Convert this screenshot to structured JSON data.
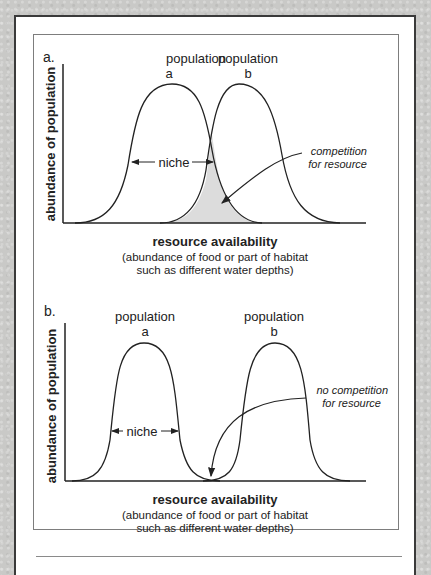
{
  "panels": [
    {
      "label": "a.",
      "population_a": {
        "line1": "population",
        "line2": "a"
      },
      "population_b": {
        "line1": "population",
        "line2": "b"
      },
      "niche_label": "niche",
      "annotation": {
        "line1": "competition",
        "line2": "for resource"
      },
      "y_axis_label": "abundance of population",
      "x_axis_title": "resource availability",
      "x_axis_sub1": "(abundance of food or part of habitat",
      "x_axis_sub2": "such as different water depths)"
    },
    {
      "label": "b.",
      "population_a": {
        "line1": "population",
        "line2": "a"
      },
      "population_b": {
        "line1": "population",
        "line2": "b"
      },
      "niche_label": "niche",
      "annotation": {
        "line1": "no competition",
        "line2": "for resource"
      },
      "y_axis_label": "abundance of population",
      "x_axis_title": "resource availability",
      "x_axis_sub1": "(abundance of food or part of habitat",
      "x_axis_sub2": "such as different water depths)"
    }
  ],
  "colors": {
    "background": "#c9c9c7",
    "frame": "#3a3a3a",
    "overlap_fill": "#dcdcdc",
    "line": "#222222"
  }
}
